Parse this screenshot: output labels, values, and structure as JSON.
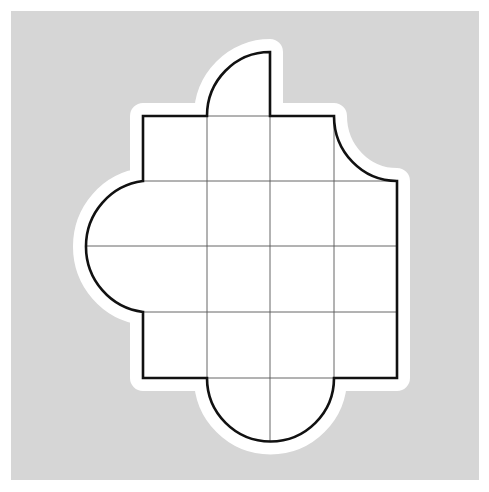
{
  "diagram": {
    "type": "grid-shape-puzzle",
    "grid": {
      "rows": 4,
      "cols": 4,
      "cell_size_px": 63.5
    },
    "colors": {
      "background": "#d6d6d6",
      "halo": "#ffffff",
      "fill": "#ffffff",
      "outline": "#111111",
      "grid_lines": "#555555"
    },
    "features": [
      {
        "name": "top-quarter-circle-tab",
        "attached_to": "top edge, column 2"
      },
      {
        "name": "top-right-concave-notch",
        "attached_to": "top-right corner cell"
      },
      {
        "name": "left-semicircle",
        "attached_to": "left edge, rows 2-3"
      },
      {
        "name": "bottom-semicircle",
        "attached_to": "bottom edge, columns 2-3"
      }
    ]
  }
}
